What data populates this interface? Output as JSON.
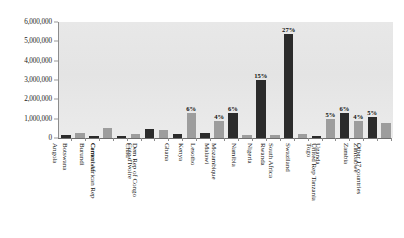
{
  "chart_data": {
    "type": "bar",
    "title": "",
    "xlabel": "",
    "ylabel": "",
    "ylim": [
      0,
      6000000
    ],
    "grid": false,
    "legend": "none",
    "ytick_labels": [
      "6,000,000",
      "5,000,000",
      "4,000,000",
      "3,000,000",
      "2,000,000",
      "1,000,000",
      "0"
    ],
    "ytick_values": [
      6000000,
      5000000,
      4000000,
      3000000,
      2000000,
      1000000,
      0
    ],
    "categories": [
      "Angola",
      "Botswana",
      "Burundi",
      "Cameroon",
      "Central African Rep",
      "Chad",
      "Cote d'Ivoire",
      "Dem Rep of Congo",
      "Ghana",
      "Kenya",
      "Lesotho",
      "Malawi",
      "Mozambique",
      "Namibia",
      "Nigeria",
      "Rwanda",
      "South Africa",
      "Swaziland",
      "Togo",
      "Uganda",
      "United Rep Tanzania",
      "Zambia",
      "Zimbabwe",
      "Other 17 countries"
    ],
    "values": [
      160000,
      280000,
      130000,
      540000,
      120000,
      200000,
      460000,
      430000,
      220000,
      1300000,
      240000,
      900000,
      1300000,
      180000,
      3000000,
      150000,
      5400000,
      220000,
      110000,
      1000000,
      1300000,
      900000,
      1100000,
      780000
    ],
    "data_labels": [
      "",
      "",
      "",
      "",
      "",
      "",
      "",
      "",
      "",
      "6%",
      "",
      "4%",
      "6%",
      "",
      "15%",
      "",
      "27%",
      "",
      "",
      "5%",
      "6%",
      "4%",
      "5%",
      ""
    ],
    "bar_colors": [
      "dark",
      "light",
      "dark",
      "light",
      "dark",
      "light",
      "dark",
      "light",
      "dark",
      "light",
      "dark",
      "light",
      "dark",
      "light",
      "dark",
      "light",
      "dark",
      "light",
      "dark",
      "light",
      "dark",
      "light",
      "dark",
      "light"
    ],
    "color_dark": "#2b2b2b",
    "color_light": "#9d9d9d",
    "plot_background": "#e6e6e6"
  }
}
